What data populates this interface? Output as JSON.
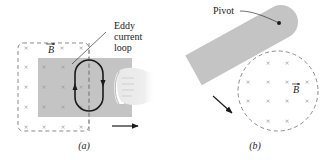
{
  "figure": {
    "panel_a": {
      "caption": "(a)",
      "labels": {
        "field": "B",
        "eddy_line1": "Eddy",
        "eddy_line2": "current",
        "eddy_line3": "loop"
      },
      "motion_direction": "right"
    },
    "panel_b": {
      "caption": "(b)",
      "labels": {
        "pivot": "Pivot",
        "field": "B"
      },
      "motion_direction": "down-right"
    },
    "symbols": {
      "field_into_page": "×"
    },
    "colors": {
      "plate": "#c4c4c4",
      "dashed": "#8a8a8a",
      "cross": "#9a9a9a",
      "ink": "#1a1a1a",
      "background": "#ffffff"
    }
  }
}
